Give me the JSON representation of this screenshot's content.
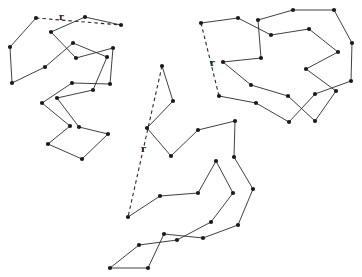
{
  "figure": {
    "colors": {
      "line": "#2a2a2a",
      "bead": "#1a1a1a",
      "background": "#ffffff"
    }
  },
  "chains": [
    {
      "id": "chain-1",
      "r_label": "r",
      "r_label_pos": [
        59,
        20
      ],
      "points": [
        [
          36,
          18
        ],
        [
          10,
          47
        ],
        [
          12,
          83
        ],
        [
          45,
          67
        ],
        [
          73,
          43
        ],
        [
          107,
          57
        ],
        [
          93,
          90
        ],
        [
          57,
          98
        ],
        [
          79,
          127
        ],
        [
          108,
          134
        ],
        [
          82,
          159
        ],
        [
          48,
          144
        ],
        [
          70,
          126
        ],
        [
          42,
          103
        ],
        [
          72,
          83
        ],
        [
          110,
          84
        ],
        [
          113,
          48
        ],
        [
          76,
          58
        ],
        [
          51,
          32
        ],
        [
          85,
          17
        ],
        [
          121,
          25
        ]
      ]
    },
    {
      "id": "chain-2",
      "r_label": "r",
      "r_label_pos": [
        210,
        66
      ],
      "points": [
        [
          201,
          23
        ],
        [
          238,
          18
        ],
        [
          271,
          35
        ],
        [
          309,
          29
        ],
        [
          338,
          52
        ],
        [
          306,
          69
        ],
        [
          336,
          91
        ],
        [
          315,
          121
        ],
        [
          288,
          96
        ],
        [
          251,
          85
        ],
        [
          223,
          62
        ],
        [
          261,
          58
        ],
        [
          258,
          20
        ],
        [
          293,
          10
        ],
        [
          334,
          10
        ],
        [
          352,
          43
        ],
        [
          351,
          81
        ],
        [
          315,
          94
        ],
        [
          289,
          122
        ],
        [
          256,
          103
        ],
        [
          219,
          96
        ]
      ]
    },
    {
      "id": "chain-3",
      "r_label": "r",
      "r_label_pos": [
        141,
        152
      ],
      "points": [
        [
          162,
          66
        ],
        [
          173,
          101
        ],
        [
          147,
          128
        ],
        [
          171,
          156
        ],
        [
          198,
          130
        ],
        [
          235,
          121
        ],
        [
          234,
          157
        ],
        [
          253,
          189
        ],
        [
          238,
          225
        ],
        [
          203,
          238
        ],
        [
          164,
          234
        ],
        [
          148,
          268
        ],
        [
          110,
          268
        ],
        [
          139,
          245
        ],
        [
          177,
          240
        ],
        [
          211,
          222
        ],
        [
          233,
          193
        ],
        [
          216,
          161
        ],
        [
          198,
          193
        ],
        [
          160,
          196
        ],
        [
          128,
          217
        ]
      ]
    }
  ]
}
